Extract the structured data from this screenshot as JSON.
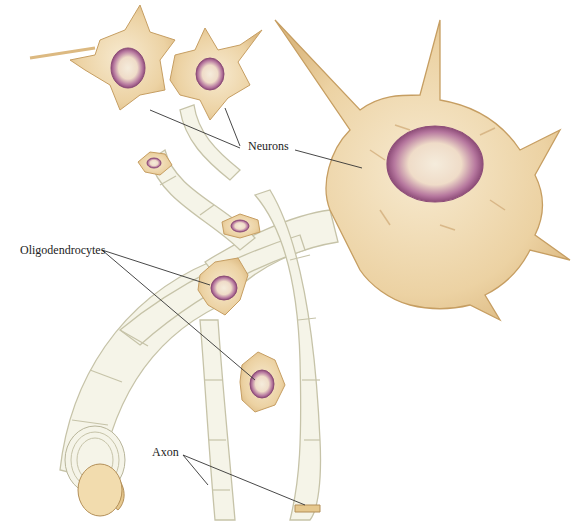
{
  "diagram": {
    "type": "anatomical illustration",
    "labels": {
      "neurons": "Neurons",
      "oligodendrocytes": "Oligodendrocytes",
      "axon": "Axon"
    },
    "colors": {
      "cytoplasm": "#ecd2a3",
      "cytoplasm_dark": "#d9b57a",
      "nucleus": "#9c5a86",
      "nucleus_inner": "#f2e8d8",
      "myelin": "#f4f3e6",
      "myelin_outline": "#c9c7b0",
      "leader_line": "#333333"
    }
  }
}
